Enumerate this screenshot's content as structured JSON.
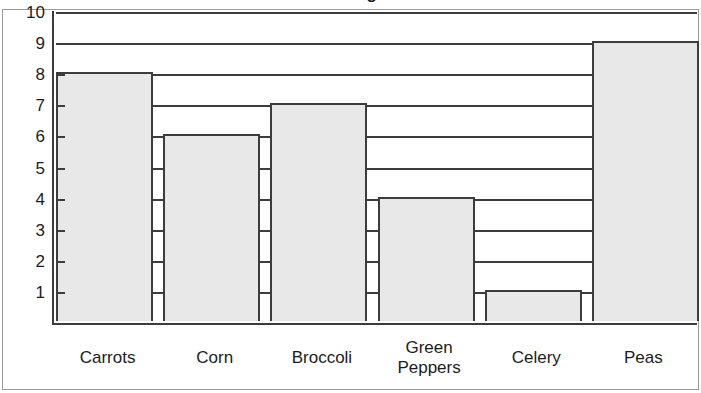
{
  "figure": {
    "title_clipped": "Favorite Vegetable",
    "frame_color": "#9a9a9a",
    "axis_color": "#3c3c3c",
    "bar_fill": "#e8e8e8",
    "background": "#ffffff"
  },
  "chart_data": {
    "type": "bar",
    "title": "Favorite Vegetable",
    "xlabel": "",
    "ylabel": "",
    "categories": [
      "Carrots",
      "Corn",
      "Broccoli",
      "Green Peppers",
      "Celery",
      "Peas"
    ],
    "values": [
      8,
      6,
      7,
      4,
      1,
      9
    ],
    "ylim": [
      0,
      10
    ],
    "ytick_labels": [
      "10",
      "9",
      "8",
      "7",
      "6",
      "5",
      "4",
      "3",
      "2",
      "1"
    ],
    "ytick_values": [
      10,
      9,
      8,
      7,
      6,
      5,
      4,
      3,
      2,
      1
    ],
    "grid": true,
    "grid_orientation": "horizontal",
    "legend": false,
    "legend_position": "none"
  },
  "y_axis": {
    "ticks": [
      {
        "label": "10",
        "value": 10
      },
      {
        "label": "9",
        "value": 9
      },
      {
        "label": "8",
        "value": 8
      },
      {
        "label": "7",
        "value": 7
      },
      {
        "label": "6",
        "value": 6
      },
      {
        "label": "5",
        "value": 5
      },
      {
        "label": "4",
        "value": 4
      },
      {
        "label": "3",
        "value": 3
      },
      {
        "label": "2",
        "value": 2
      },
      {
        "label": "1",
        "value": 1
      }
    ]
  },
  "x_axis": {
    "categories": [
      {
        "label": "Carrots",
        "lines": [
          "Carrots"
        ]
      },
      {
        "label": "Corn",
        "lines": [
          "Corn"
        ]
      },
      {
        "label": "Broccoli",
        "lines": [
          "Broccoli"
        ]
      },
      {
        "label": "Green Peppers",
        "lines": [
          "Green",
          "Peppers"
        ]
      },
      {
        "label": "Celery",
        "lines": [
          "Celery"
        ]
      },
      {
        "label": "Peas",
        "lines": [
          "Peas"
        ]
      }
    ]
  },
  "bars": [
    {
      "category": "Carrots",
      "value": 8
    },
    {
      "category": "Corn",
      "value": 6
    },
    {
      "category": "Broccoli",
      "value": 7
    },
    {
      "category": "Green Peppers",
      "value": 4
    },
    {
      "category": "Celery",
      "value": 1
    },
    {
      "category": "Peas",
      "value": 9
    }
  ]
}
